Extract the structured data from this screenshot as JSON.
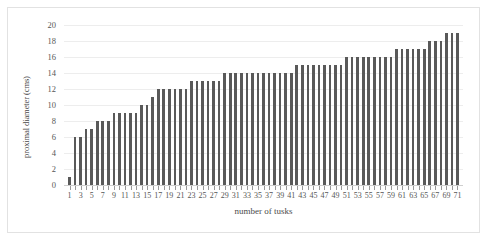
{
  "chart_data": {
    "type": "bar",
    "title": "",
    "xlabel": "number of tusks",
    "ylabel": "proximal diameter (cms)",
    "xlim": [
      0,
      72
    ],
    "ylim": [
      0,
      20
    ],
    "ytick_step": 2,
    "yticks": [
      0,
      2,
      4,
      6,
      8,
      10,
      12,
      14,
      16,
      18,
      20
    ],
    "ytick_labels": [
      "0",
      "2",
      "4",
      "6",
      "8",
      "10",
      "12",
      "14",
      "16",
      "18",
      "20"
    ],
    "xticks": [
      1,
      3,
      5,
      7,
      9,
      11,
      13,
      15,
      17,
      19,
      21,
      23,
      25,
      27,
      29,
      31,
      33,
      35,
      37,
      39,
      41,
      43,
      45,
      47,
      49,
      51,
      53,
      55,
      57,
      59,
      61,
      63,
      65,
      67,
      69,
      71
    ],
    "xtick_labels": [
      "1",
      "3",
      "5",
      "7",
      "9",
      "11",
      "13",
      "15",
      "17",
      "19",
      "21",
      "23",
      "25",
      "27",
      "29",
      "31",
      "33",
      "35",
      "37",
      "39",
      "41",
      "43",
      "45",
      "47",
      "49",
      "51",
      "53",
      "55",
      "57",
      "59",
      "61",
      "63",
      "65",
      "67",
      "69",
      "71"
    ],
    "grid": true,
    "grid_axis": "y",
    "legend": false,
    "bar_color": "#595959",
    "gridline_color": "#ededed",
    "categories": [
      1,
      2,
      3,
      4,
      5,
      6,
      7,
      8,
      9,
      10,
      11,
      12,
      13,
      14,
      15,
      16,
      17,
      18,
      19,
      20,
      21,
      22,
      23,
      24,
      25,
      26,
      27,
      28,
      29,
      30,
      31,
      32,
      33,
      34,
      35,
      36,
      37,
      38,
      39,
      40,
      41,
      42,
      43,
      44,
      45,
      46,
      47,
      48,
      49,
      50,
      51,
      52,
      53,
      54,
      55,
      56,
      57,
      58,
      59,
      60,
      61,
      62,
      63,
      64,
      65,
      66,
      67,
      68,
      69,
      70,
      71
    ],
    "values": [
      1,
      6,
      6,
      7,
      7,
      8,
      8,
      8,
      9,
      9,
      9,
      9,
      9,
      10,
      10,
      11,
      12,
      12,
      12,
      12,
      12,
      12,
      13,
      13,
      13,
      13,
      13,
      13,
      14,
      14,
      14,
      14,
      14,
      14,
      14,
      14,
      14,
      14,
      14,
      14,
      14,
      15,
      15,
      15,
      15,
      15,
      15,
      15,
      15,
      15,
      16,
      16,
      16,
      16,
      16,
      16,
      16,
      16,
      16,
      17,
      17,
      17,
      17,
      17,
      17,
      18,
      18,
      18,
      19,
      19,
      19
    ],
    "series": [
      {
        "name": "proximal diameter",
        "values": [
          1,
          6,
          6,
          7,
          7,
          8,
          8,
          8,
          9,
          9,
          9,
          9,
          9,
          10,
          10,
          11,
          12,
          12,
          12,
          12,
          12,
          12,
          13,
          13,
          13,
          13,
          13,
          13,
          14,
          14,
          14,
          14,
          14,
          14,
          14,
          14,
          14,
          14,
          14,
          14,
          14,
          15,
          15,
          15,
          15,
          15,
          15,
          15,
          15,
          15,
          16,
          16,
          16,
          16,
          16,
          16,
          16,
          16,
          16,
          17,
          17,
          17,
          17,
          17,
          17,
          18,
          18,
          18,
          19,
          19,
          19
        ]
      }
    ]
  }
}
